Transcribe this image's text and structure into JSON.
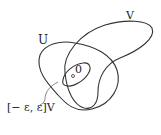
{
  "diagram": {
    "labels": {
      "U": "U",
      "V": "V",
      "origin": "0",
      "interval_set": "[− ε,  ε]V"
    },
    "colors": {
      "stroke": "#333333",
      "text": "#222222"
    }
  }
}
